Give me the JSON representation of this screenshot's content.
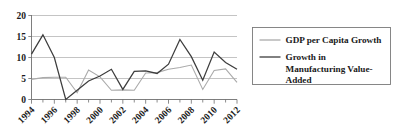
{
  "chart_data": {
    "type": "line",
    "title": "",
    "xlabel": "",
    "ylabel": "",
    "x": [
      1994,
      1995,
      1996,
      1997,
      1998,
      1999,
      2000,
      2001,
      2002,
      2003,
      2004,
      2005,
      2006,
      2007,
      2008,
      2009,
      2010,
      2011,
      2012
    ],
    "xlim": [
      1994,
      2012
    ],
    "ylim": [
      0,
      20
    ],
    "yticks": [
      0,
      5,
      10,
      15,
      20
    ],
    "ytick_labels": [
      "0",
      "5",
      "10",
      "15",
      "20"
    ],
    "xtick_labels": [
      "1994",
      "1996",
      "1998",
      "2000",
      "2002",
      "2004",
      "2006",
      "2008",
      "2010",
      "2012"
    ],
    "xticks_major": [
      1994,
      1996,
      1998,
      2000,
      2002,
      2004,
      2006,
      2008,
      2010,
      2012
    ],
    "xticks_minor": [
      1995,
      1997,
      1999,
      2001,
      2003,
      2005,
      2007,
      2009,
      2011
    ],
    "grid": true,
    "grid_axis": "y",
    "legend_position": "right",
    "series": [
      {
        "name": "GDP per Capita Growth",
        "color": "#aaaaaa",
        "width": 1.1,
        "values": [
          4.8,
          5.2,
          5.3,
          5.3,
          1.6,
          7.0,
          5.4,
          2.2,
          2.3,
          2.2,
          6.3,
          6.4,
          7.2,
          7.6,
          8.2,
          2.4,
          6.9,
          7.3,
          4.1
        ]
      },
      {
        "name": "Growth in Manufacturing Value-Added",
        "color": "#3d3d3d",
        "width": 1.25,
        "values": [
          10.8,
          15.4,
          10.0,
          0.0,
          2.2,
          4.4,
          5.6,
          7.2,
          2.4,
          6.7,
          6.8,
          6.2,
          8.4,
          14.3,
          10.2,
          4.6,
          11.3,
          8.8,
          7.2
        ]
      }
    ],
    "annotations": []
  },
  "legend": {
    "entries": [
      {
        "label": "GDP per Capita Growth"
      },
      {
        "label": "Growth in Manufacturing Value-Added"
      }
    ],
    "entry2_line1": "Growth in",
    "entry2_line2": "Manufacturing Value-",
    "entry2_line3": "Added"
  }
}
